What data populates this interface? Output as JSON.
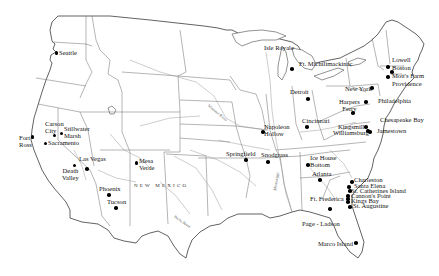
{
  "map": {
    "title": "",
    "region_label": "NEW MEXICO",
    "river_labels": [
      "Missouri River",
      "Pecos River",
      "Mississippi"
    ],
    "sites": [
      {
        "name": "Seattle",
        "label": "Seattle"
      },
      {
        "name": "Isle Royale",
        "label": "Isle Royale"
      },
      {
        "name": "Ft. Michilimackinac",
        "label": "Ft. Michilimackinac"
      },
      {
        "name": "Lowell",
        "label": "Lowell"
      },
      {
        "name": "Boston",
        "label": "Boston"
      },
      {
        "name": "Mott's Farm",
        "label": "Mott's Farm"
      },
      {
        "name": "Providence",
        "label": "Providence"
      },
      {
        "name": "New York",
        "label": "New York"
      },
      {
        "name": "Detroit",
        "label": "Detroit"
      },
      {
        "name": "Philadelphia",
        "label": "Philadelphia"
      },
      {
        "name": "Harpers Ferry",
        "label": "Harpers\nFerry"
      },
      {
        "name": "Chesapeake Bay",
        "label": "Chesapeake Bay"
      },
      {
        "name": "Kingsmill",
        "label": "Kingsmill"
      },
      {
        "name": "Williamsburg",
        "label": "Williamsburg"
      },
      {
        "name": "Jamestown",
        "label": "Jamestown"
      },
      {
        "name": "Carson City",
        "label": "Carson\nCity"
      },
      {
        "name": "Stillwater Marsh",
        "label": "Stillwater\nMarsh"
      },
      {
        "name": "Fort Ross",
        "label": "Fort\nRoss"
      },
      {
        "name": "Sacramento",
        "label": "Sacramento"
      },
      {
        "name": "Napoleon Hollow",
        "label": "Napoleon\nHollow"
      },
      {
        "name": "Cincinnati",
        "label": "Cincinnati"
      },
      {
        "name": "Las Vegas",
        "label": "Las Vegas"
      },
      {
        "name": "Mesa Verde",
        "label": "Mesa\nVerde"
      },
      {
        "name": "Death Valley",
        "label": "Death\nValley"
      },
      {
        "name": "Springfield",
        "label": "Springfield"
      },
      {
        "name": "Snodgrass",
        "label": "Snodgrass"
      },
      {
        "name": "Ice House Bottom",
        "label": "Ice House\nBottom"
      },
      {
        "name": "Atlanta",
        "label": "Atlanta"
      },
      {
        "name": "Charleston",
        "label": "Charleston"
      },
      {
        "name": "Santa Elena",
        "label": "Santa Elena"
      },
      {
        "name": "St. Catherines Island",
        "label": "St. Catherines Island"
      },
      {
        "name": "Cannon's Point",
        "label": "Cannon's Point"
      },
      {
        "name": "Ft. Frederica",
        "label": "Ft. Frederica"
      },
      {
        "name": "Kings Bay",
        "label": "Kings Bay"
      },
      {
        "name": "St. Augustine",
        "label": "St. Augustine"
      },
      {
        "name": "Phoenix",
        "label": "Phoenix"
      },
      {
        "name": "Tucson",
        "label": "Tucson"
      },
      {
        "name": "Page - Ladson",
        "label": "Page - Ladson"
      },
      {
        "name": "Marco Island",
        "label": "Marco Island"
      }
    ]
  }
}
